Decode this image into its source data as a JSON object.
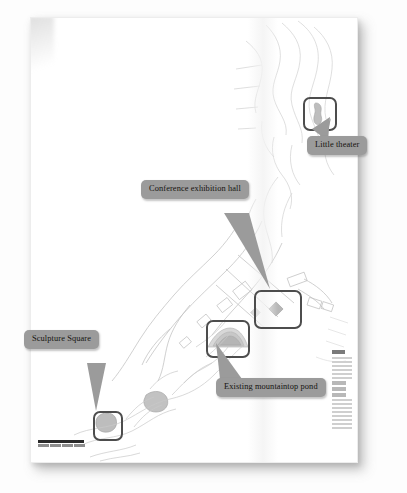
{
  "document": {
    "type": "annotated-site-plan-scan",
    "paper_background": "#ffffff",
    "page_background": "#fdfdfd"
  },
  "styles": {
    "callout_fill": "#9b9b9b",
    "callout_text_color": "#15130f",
    "highlight_border_color": "#4d4d4d",
    "map_line_color": "#c9c9c9",
    "scalebar_color": "#2a2a2a"
  },
  "callouts": [
    {
      "id": "little-theater",
      "label": "Little theater",
      "x": 307,
      "y": 136,
      "target_x": 285,
      "target_y": 102
    },
    {
      "id": "conference-exhibition-hall",
      "label": "Conference exhibition hall",
      "x": 141,
      "y": 180,
      "target_x": 247,
      "target_y": 284
    },
    {
      "id": "sculpture-square",
      "label": "Sculpture Square",
      "x": 24,
      "y": 330,
      "target_x": 77,
      "target_y": 398
    },
    {
      "id": "existing-mountaintop-pond",
      "label": "Existing mountaintop pond",
      "x": 216,
      "y": 378,
      "target_x": 203,
      "target_y": 338
    }
  ],
  "highlights": [
    {
      "id": "highlight-little-theater",
      "x": 273,
      "y": 80,
      "w": 30,
      "h": 30
    },
    {
      "id": "highlight-conference-hall",
      "x": 224,
      "y": 273,
      "w": 44,
      "h": 35
    },
    {
      "id": "highlight-mountaintop-pond",
      "x": 176,
      "y": 303,
      "w": 40,
      "h": 34
    },
    {
      "id": "highlight-sculpture-square",
      "x": 63,
      "y": 394,
      "w": 26,
      "h": 26
    }
  ],
  "map_features": {
    "scale_bar": {
      "present": true,
      "position": "bottom-left"
    },
    "legend": {
      "present": true,
      "position": "bottom-right",
      "legible": false
    },
    "pond_blob": {
      "x": 196,
      "y": 320
    },
    "plaza_diamond": {
      "x": 246,
      "y": 292
    },
    "theater_blob": {
      "x": 288,
      "y": 95
    },
    "sculpture_blob": {
      "x": 76,
      "y": 406
    }
  }
}
